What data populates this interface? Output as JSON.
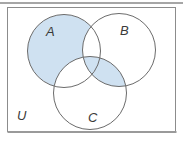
{
  "figure": {
    "type": "venn-diagram",
    "universe_label": "U",
    "set_labels": {
      "a": "A",
      "b": "B",
      "c": "C"
    },
    "shaded_regions": [
      "A minus (B union C)",
      "B intersect C (entire lens, including A∩B∩C center)"
    ],
    "unshaded_overlaps": [
      "A intersect B only",
      "A intersect C only"
    ],
    "colors": {
      "shade_fill": "#cfe1f1",
      "circle_stroke": "#6b6b6b",
      "frame_border": "#8c8c8c",
      "top_rule": "#a6a6a6",
      "background": "#ffffff",
      "label_text": "#3a3a3a"
    }
  }
}
